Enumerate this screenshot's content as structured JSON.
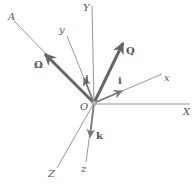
{
  "diagram": {
    "origin_label": "O",
    "axes": {
      "fixed": [
        {
          "name": "X",
          "label": "X"
        },
        {
          "name": "Y",
          "label": "Y"
        },
        {
          "name": "Z",
          "label": "Z"
        }
      ],
      "moving": [
        {
          "name": "x",
          "label": "x"
        },
        {
          "name": "y",
          "label": "y"
        },
        {
          "name": "z",
          "label": "z"
        }
      ],
      "line_A": {
        "label": "A"
      }
    },
    "unit_vectors": [
      {
        "name": "i",
        "label": "i"
      },
      {
        "name": "j",
        "label": "j"
      },
      {
        "name": "k",
        "label": "k"
      }
    ],
    "vectors": [
      {
        "name": "omega",
        "label": "Ω"
      },
      {
        "name": "Q",
        "label": "Q"
      }
    ],
    "colors": {
      "axis_line": "#7a7a7a",
      "vector": "#666666",
      "label": "#555555"
    }
  }
}
